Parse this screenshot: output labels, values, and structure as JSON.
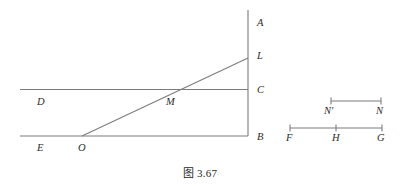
{
  "figure": {
    "caption": "图 3.67",
    "stroke_color": "#7c7c7c",
    "label_color": "#2b2b2b",
    "background_color": "#ffffff",
    "labels": {
      "A": "A",
      "L": "L",
      "C": "C",
      "B": "B",
      "D": "D",
      "E": "E",
      "O": "O",
      "M": "M",
      "N_prime": "N'",
      "N": "N",
      "F": "F",
      "H": "H",
      "G": "G"
    },
    "label_positions": {
      "A": {
        "x": 257,
        "y": 18
      },
      "L": {
        "x": 257,
        "y": 51
      },
      "C": {
        "x": 257,
        "y": 86
      },
      "B": {
        "x": 257,
        "y": 133
      },
      "D": {
        "x": 37,
        "y": 98
      },
      "E": {
        "x": 37,
        "y": 144
      },
      "O": {
        "x": 78,
        "y": 144
      },
      "M": {
        "x": 167,
        "y": 99
      },
      "N_prime": {
        "x": 324,
        "y": 108
      },
      "N": {
        "x": 376,
        "y": 108
      },
      "F": {
        "x": 286,
        "y": 135
      },
      "H": {
        "x": 332,
        "y": 135
      },
      "G": {
        "x": 377,
        "y": 135
      }
    },
    "geometry": {
      "vertical_line": {
        "x": 248,
        "y_top": 10,
        "y_bottom": 136
      },
      "line_DC": {
        "x1": 20,
        "y1": 89.5,
        "x2": 248,
        "y2": 89.5
      },
      "line_EB": {
        "x1": 20,
        "y1": 136,
        "x2": 248,
        "y2": 136
      },
      "line_OL": {
        "x1": 82,
        "y1": 136,
        "x2": 248,
        "y2": 58
      },
      "point_A": {
        "x": 248,
        "y": 22
      },
      "point_L": {
        "x": 248,
        "y": 58
      },
      "point_C": {
        "x": 248,
        "y": 89.5
      },
      "point_B": {
        "x": 248,
        "y": 136
      },
      "point_O": {
        "x": 82,
        "y": 136
      },
      "point_M": {
        "x": 167,
        "y": 89.5
      },
      "segment_NprimeN": {
        "x1": 331,
        "y": 101,
        "x2": 381
      },
      "segment_FG": {
        "x1": 290,
        "y": 128,
        "x2": 382
      },
      "tick_H": {
        "x": 336,
        "y": 128
      },
      "tick_half_height": 3.5
    }
  }
}
